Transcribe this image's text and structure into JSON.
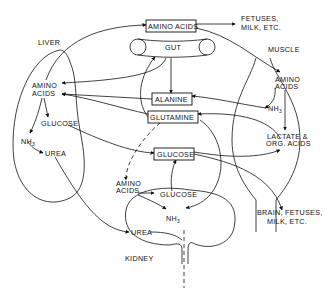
{
  "diagram": {
    "organs": {
      "liver": "LIVER",
      "muscle": "MUSCLE",
      "gut": "GUT",
      "kidney": "KIDNEY"
    },
    "central_boxes": {
      "amino_acids": "AMINO ACIDS",
      "alanine": "ALANINE",
      "glutamine": "GLUTAMINE",
      "glucose": "GLUCOSE"
    },
    "liver_nodes": {
      "amino": "AMINO",
      "acids": "ACIDS",
      "glucose": "GLUCOSE",
      "nh3_base": "NH",
      "nh3_sub": "3",
      "urea": "UREA"
    },
    "muscle_nodes": {
      "amino": "AMINO",
      "acids": "ACIDS",
      "nh3_base": "NH",
      "nh3_sub": "3",
      "lactate": "LACTATE &",
      "org_acids": "ORG. ACIDS"
    },
    "kidney_nodes": {
      "amino": "AMINO",
      "acids": "ACIDS",
      "glucose": "GLUCOSE",
      "nh3_base": "NH",
      "nh3_sub": "3",
      "urea": "UREA"
    },
    "destinations": {
      "top_line1": "FETUSES,",
      "top_line2": "MILK, ETC.",
      "bottom_line1": "BRAIN, FETUSES,",
      "bottom_line2": "MILK, ETC."
    },
    "colors": {
      "ink": "#111111",
      "background": "#ffffff"
    }
  }
}
